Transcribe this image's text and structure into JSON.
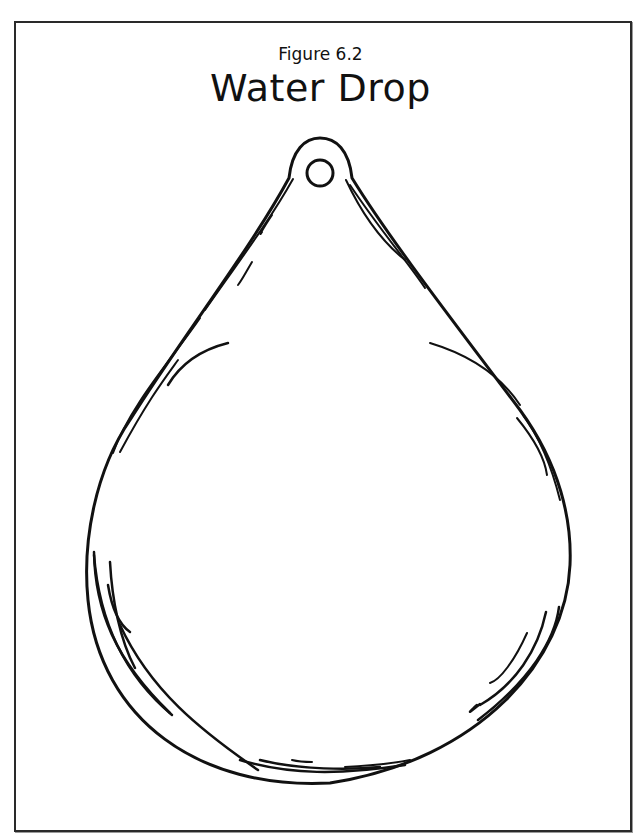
{
  "figure": {
    "caption": "Figure 6.2",
    "title": "Water Drop"
  },
  "drawing": {
    "subject": "water-drop-outline",
    "stroke_color": "#111111",
    "background_color": "#ffffff",
    "border_color": "#2a2a2a"
  }
}
